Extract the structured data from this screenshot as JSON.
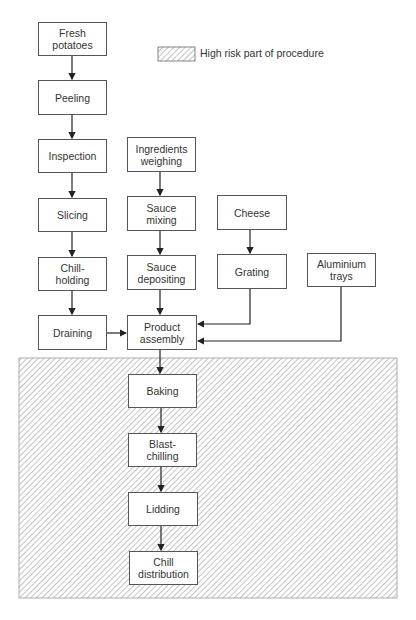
{
  "legend": {
    "label": "High risk part of procedure",
    "pattern": "diagonal-hatch"
  },
  "colors": {
    "line": "#333333",
    "box_border": "#555555",
    "hatch": "#9a9a9a",
    "background": "#ffffff"
  },
  "nodes": {
    "fresh_potatoes": "Fresh\npotatoes",
    "peeling": "Peeling",
    "inspection": "Inspection",
    "slicing": "Slicing",
    "chill_holding": "Chill-\nholding",
    "draining": "Draining",
    "ingredients_weighing": "Ingredients\nweighing",
    "sauce_mixing": "Sauce\nmixing",
    "sauce_depositing": "Sauce\ndepositing",
    "product_assembly": "Product\nassembly",
    "cheese": "Cheese",
    "grating": "Grating",
    "aluminium_trays": "Aluminium\ntrays",
    "baking": "Baking",
    "blast_chilling": "Blast-\nchilling",
    "lidding": "Lidding",
    "chill_distribution": "Chill\ndistribution"
  },
  "edges": [
    [
      "fresh_potatoes",
      "peeling"
    ],
    [
      "peeling",
      "inspection"
    ],
    [
      "inspection",
      "slicing"
    ],
    [
      "slicing",
      "chill_holding"
    ],
    [
      "chill_holding",
      "draining"
    ],
    [
      "draining",
      "product_assembly"
    ],
    [
      "ingredients_weighing",
      "sauce_mixing"
    ],
    [
      "sauce_mixing",
      "sauce_depositing"
    ],
    [
      "sauce_depositing",
      "product_assembly"
    ],
    [
      "cheese",
      "grating"
    ],
    [
      "grating",
      "product_assembly"
    ],
    [
      "aluminium_trays",
      "product_assembly"
    ],
    [
      "product_assembly",
      "baking"
    ],
    [
      "baking",
      "blast_chilling"
    ],
    [
      "blast_chilling",
      "lidding"
    ],
    [
      "lidding",
      "chill_distribution"
    ]
  ],
  "high_risk_nodes": [
    "baking",
    "blast_chilling",
    "lidding",
    "chill_distribution"
  ]
}
